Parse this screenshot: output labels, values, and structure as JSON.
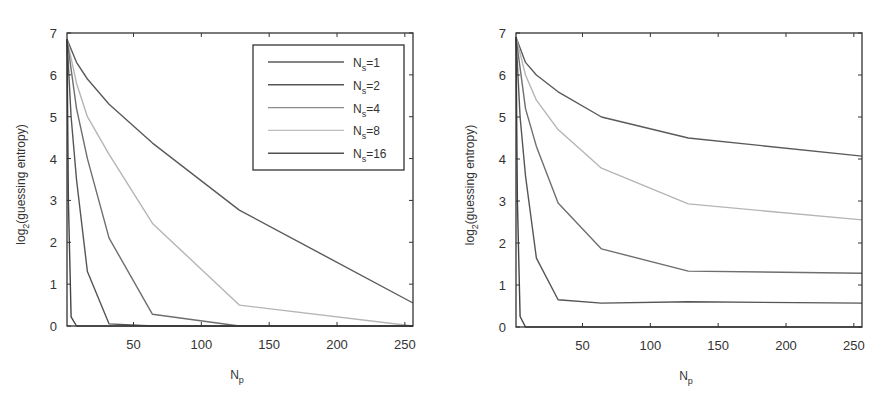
{
  "chart_data": [
    {
      "type": "line",
      "panel": "left",
      "title": "",
      "xlabel": "N_p",
      "ylabel": "log_2(guessing entropy)",
      "xlim": [
        1,
        256
      ],
      "ylim": [
        0,
        7
      ],
      "xticks": [
        50,
        100,
        150,
        200,
        250
      ],
      "yticks": [
        0,
        1,
        2,
        3,
        4,
        5,
        6,
        7
      ],
      "grid": false,
      "legend_position": "upper right",
      "series": [
        {
          "name": "N_s=1",
          "color": "#5a5a5a",
          "x": [
            1,
            8,
            16,
            32,
            64,
            128,
            256
          ],
          "y": [
            6.85,
            6.3,
            5.9,
            5.3,
            4.37,
            2.77,
            0.55
          ]
        },
        {
          "name": "N_s=2",
          "color": "#b5b5b5",
          "x": [
            1,
            8,
            16,
            32,
            64,
            128,
            256
          ],
          "y": [
            6.85,
            5.8,
            5.0,
            4.1,
            2.45,
            0.5,
            0.0
          ]
        },
        {
          "name": "N_s=4",
          "color": "#6e6e6e",
          "x": [
            1,
            8,
            16,
            32,
            64,
            128,
            256
          ],
          "y": [
            6.85,
            5.2,
            4.0,
            2.1,
            0.28,
            0.0,
            0.0
          ]
        },
        {
          "name": "N_s=8",
          "color": "#555555",
          "x": [
            1,
            4,
            8,
            16,
            32,
            64,
            256
          ],
          "y": [
            6.85,
            5.0,
            3.5,
            1.3,
            0.05,
            0.0,
            0.0
          ]
        },
        {
          "name": "N_s=16",
          "color": "#444444",
          "x": [
            1,
            2,
            4,
            8,
            16,
            256
          ],
          "y": [
            6.85,
            3.0,
            0.22,
            0.0,
            0.0,
            0.0
          ]
        }
      ]
    },
    {
      "type": "line",
      "panel": "right",
      "title": "",
      "xlabel": "N_p",
      "ylabel": "log_2(guessing entropy)",
      "xlim": [
        1,
        256
      ],
      "ylim": [
        0,
        7
      ],
      "xticks": [
        50,
        100,
        150,
        200,
        250
      ],
      "yticks": [
        0,
        1,
        2,
        3,
        4,
        5,
        6,
        7
      ],
      "grid": false,
      "legend_position": "none",
      "series": [
        {
          "name": "N_s=1",
          "color": "#5a5a5a",
          "x": [
            1,
            8,
            16,
            32,
            64,
            128,
            256
          ],
          "y": [
            6.9,
            6.3,
            6.0,
            5.6,
            5.0,
            4.5,
            4.07
          ]
        },
        {
          "name": "N_s=2",
          "color": "#b5b5b5",
          "x": [
            1,
            8,
            16,
            32,
            64,
            128,
            256
          ],
          "y": [
            6.9,
            6.0,
            5.4,
            4.7,
            3.78,
            2.93,
            2.55
          ]
        },
        {
          "name": "N_s=4",
          "color": "#6e6e6e",
          "x": [
            1,
            8,
            16,
            32,
            64,
            128,
            256
          ],
          "y": [
            6.9,
            5.2,
            4.3,
            2.95,
            1.86,
            1.33,
            1.28
          ]
        },
        {
          "name": "N_s=8",
          "color": "#555555",
          "x": [
            1,
            4,
            8,
            16,
            32,
            64,
            128,
            256
          ],
          "y": [
            6.9,
            5.0,
            3.6,
            1.64,
            0.65,
            0.57,
            0.6,
            0.57
          ]
        },
        {
          "name": "N_s=16",
          "color": "#444444",
          "x": [
            1,
            2,
            4,
            8,
            256
          ],
          "y": [
            6.9,
            3.0,
            0.25,
            0.0,
            0.0
          ]
        }
      ]
    }
  ],
  "panels": {
    "left": {
      "ylabel_main": "log",
      "ylabel_sub": "2",
      "ylabel_rest": "(guessing entropy)",
      "xlabel_main": "N",
      "xlabel_sub": "p"
    },
    "right": {
      "ylabel_main": "log",
      "ylabel_sub": "2",
      "ylabel_rest": "(guessing entropy)",
      "xlabel_main": "N",
      "xlabel_sub": "p"
    }
  },
  "legend": {
    "items": [
      {
        "main": "N",
        "sub": "s",
        "rest": "=1",
        "color": "#5a5a5a"
      },
      {
        "main": "N",
        "sub": "s",
        "rest": "=2",
        "color": "#555555"
      },
      {
        "main": "N",
        "sub": "s",
        "rest": "=4",
        "color": "#8a8a8a"
      },
      {
        "main": "N",
        "sub": "s",
        "rest": "=8",
        "color": "#bdbdbd"
      },
      {
        "main": "N",
        "sub": "s",
        "rest": "=16",
        "color": "#505050"
      }
    ]
  }
}
